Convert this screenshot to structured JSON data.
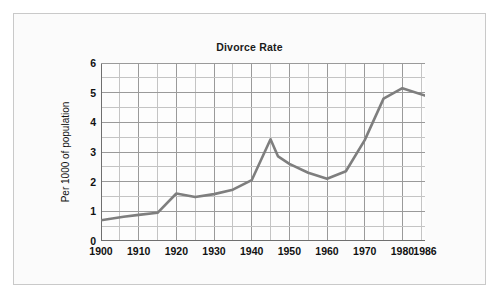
{
  "chart_data": {
    "type": "line",
    "title": "Divorce Rate",
    "xlabel": "",
    "ylabel": "Per 1000 of population",
    "xlim": [
      1900,
      1986
    ],
    "ylim": [
      0,
      6
    ],
    "grid": true,
    "legend": "none",
    "x_major_ticks": [
      1900,
      1910,
      1920,
      1930,
      1940,
      1950,
      1960,
      1970,
      1980,
      1986
    ],
    "x_tick_labels": [
      "1900",
      "1910",
      "1920",
      "1930",
      "1940",
      "1950",
      "1960",
      "1970",
      "1980",
      "1986"
    ],
    "x_minor_step": 5,
    "y_major_ticks": [
      0,
      1,
      2,
      3,
      4,
      5,
      6
    ],
    "y_tick_labels": [
      "0",
      "1",
      "2",
      "3",
      "4",
      "5",
      "6"
    ],
    "y_minor_step": 0.5,
    "line_color": "#7e7e7e",
    "grid_color": "#9a9a9a",
    "minor_grid_color": "#c4c4c4",
    "axis_color": "#6f6f6f",
    "x": [
      1900,
      1906,
      1910,
      1915,
      1920,
      1925,
      1930,
      1935,
      1940,
      1945,
      1947,
      1950,
      1955,
      1960,
      1965,
      1970,
      1975,
      1980,
      1986
    ],
    "values": [
      0.7,
      0.82,
      0.88,
      0.95,
      1.6,
      1.48,
      1.58,
      1.73,
      2.05,
      3.43,
      2.85,
      2.6,
      2.3,
      2.1,
      2.35,
      3.4,
      4.8,
      5.15,
      4.9
    ],
    "series": [
      {
        "name": "Divorce rate",
        "values": [
          0.7,
          0.82,
          0.88,
          0.95,
          1.6,
          1.48,
          1.58,
          1.73,
          2.05,
          3.43,
          2.85,
          2.6,
          2.3,
          2.1,
          2.35,
          3.4,
          4.8,
          5.15,
          4.9
        ]
      }
    ]
  },
  "figure": {
    "background": "#fbfbfb",
    "border_color": "#c9c9c9"
  }
}
